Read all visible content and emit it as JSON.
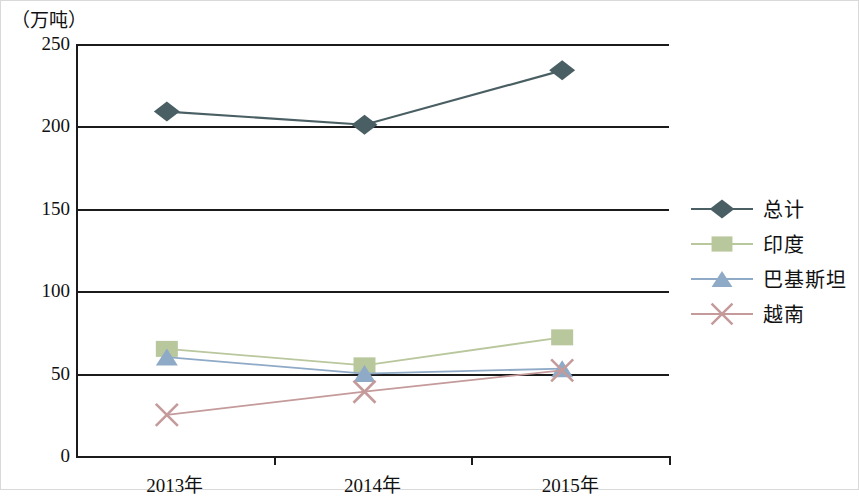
{
  "axis_unit": "（万吨）",
  "chart_data": {
    "type": "line",
    "title": "",
    "xlabel": "",
    "ylabel": "（万吨）",
    "categories": [
      "2013年",
      "2014年",
      "2015年"
    ],
    "ylim": [
      0,
      250
    ],
    "ytick_labels": [
      "0",
      "50",
      "100",
      "150",
      "200",
      "250"
    ],
    "ytick_values": [
      0,
      50,
      100,
      150,
      200,
      250
    ],
    "grid": true,
    "legend_position": "right",
    "series": [
      {
        "name": "总计",
        "values": [
          209,
          201,
          234
        ],
        "color": "#4a5f63",
        "marker": "diamond"
      },
      {
        "name": "印度",
        "values": [
          65,
          55,
          72
        ],
        "color": "#b9c79d",
        "marker": "square"
      },
      {
        "name": "巴基斯坦",
        "values": [
          60,
          50,
          53
        ],
        "color": "#8faac6",
        "marker": "triangle"
      },
      {
        "name": "越南",
        "values": [
          25,
          39,
          52
        ],
        "color": "#c59a9a",
        "marker": "cross"
      }
    ]
  },
  "legend": {
    "items": [
      {
        "label": "总计",
        "color": "#4a5f63",
        "marker": "diamond"
      },
      {
        "label": "印度",
        "color": "#b9c79d",
        "marker": "square"
      },
      {
        "label": "巴基斯坦",
        "color": "#8faac6",
        "marker": "triangle"
      },
      {
        "label": "越南",
        "color": "#c59a9a",
        "marker": "cross"
      }
    ]
  }
}
